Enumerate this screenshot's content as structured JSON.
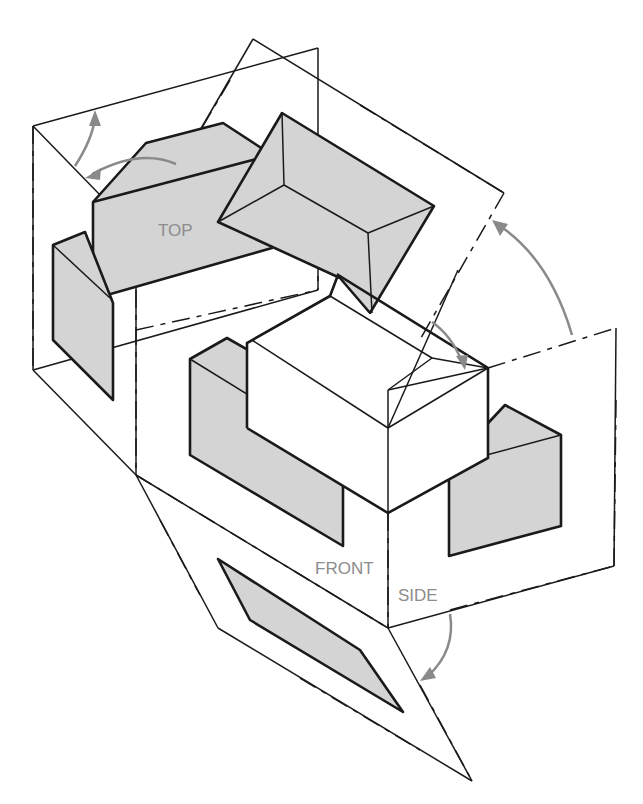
{
  "figure": {
    "labels": {
      "top": "TOP",
      "front": "FRONT",
      "side": "SIDE"
    },
    "colors": {
      "line": "#1a1a1a",
      "shaded_view": "#d4d4d4",
      "rotation_arrow": "#8a8a8a",
      "label_text": "#8c8c8c"
    },
    "planes": [
      "top-plane",
      "front-plane",
      "side-plane",
      "rear-plane",
      "left-side-plane",
      "bottom-plane"
    ],
    "rotation_arrows": 5
  }
}
